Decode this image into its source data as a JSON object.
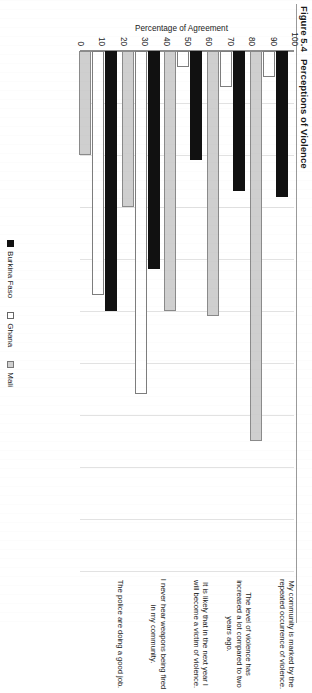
{
  "figure": {
    "number": "Figure 5.4",
    "title": "Perceptions of Violence"
  },
  "legend": {
    "position": "bottom-center",
    "items": [
      {
        "label": "Burkina Faso",
        "swatch": "black-square-icon",
        "color": "#111111"
      },
      {
        "label": "Ghana",
        "swatch": "white-square-icon",
        "color": "#ffffff"
      },
      {
        "label": "Mali",
        "swatch": "gray-square-icon",
        "color": "#cfcfcf"
      }
    ]
  },
  "chart_data": {
    "type": "bar",
    "orientation": "vertical",
    "title": "Perceptions of Violence",
    "xlabel": "",
    "ylabel": "Percentage of Agreement",
    "ylim": [
      0,
      100
    ],
    "yticks": [
      0,
      10,
      20,
      30,
      40,
      50,
      60,
      70,
      80,
      90,
      100
    ],
    "grid": true,
    "categories": [
      "My community is marked by the repeated occurrence of violence.",
      "The level of violence has increased a lot compared to two years ago.",
      "It is likely that in the next year I will become a victim of violence.",
      "I never hear weapons being fired in my community.",
      "The police are doing a good job."
    ],
    "series": [
      {
        "name": "Burkina Faso",
        "color": "#111111",
        "values": [
          28,
          27,
          21,
          42,
          50
        ]
      },
      {
        "name": "Ghana",
        "color": "#ffffff",
        "values": [
          5,
          7,
          3,
          66,
          47
        ]
      },
      {
        "name": "Mali",
        "color": "#cfcfcf",
        "values": [
          75,
          51,
          50,
          30,
          20
        ]
      }
    ]
  }
}
